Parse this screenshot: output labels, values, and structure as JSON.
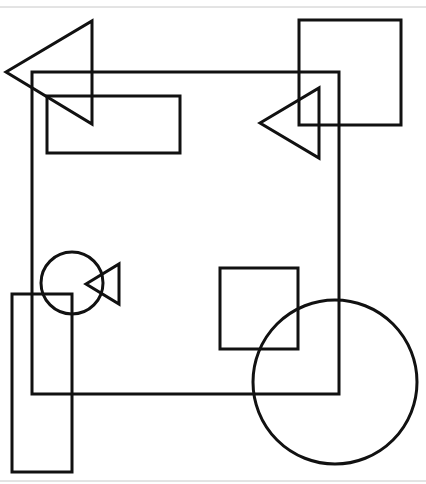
{
  "canvas": {
    "width": 426,
    "height": 484,
    "background": "#ffffff",
    "stroke": "#111111",
    "stroke_width": 3,
    "rule_color": "#c8c8c8"
  },
  "rules": [
    {
      "name": "top-rule",
      "x1": 0,
      "y1": 7,
      "x2": 426,
      "y2": 7
    },
    {
      "name": "bottom-rule",
      "x1": 0,
      "y1": 481,
      "x2": 426,
      "y2": 481
    }
  ],
  "shapes": [
    {
      "type": "rect",
      "name": "large-square",
      "x": 32,
      "y": 72,
      "w": 307,
      "h": 322
    },
    {
      "type": "polygon",
      "name": "triangle-top-left",
      "points": "6,72 92,21 92,124"
    },
    {
      "type": "rect",
      "name": "wide-rectangle",
      "x": 47,
      "y": 96,
      "w": 133,
      "h": 57
    },
    {
      "type": "rect",
      "name": "square-top-right",
      "x": 299,
      "y": 20,
      "w": 102,
      "h": 105
    },
    {
      "type": "polygon",
      "name": "triangle-right",
      "points": "260,123 319,88 319,158"
    },
    {
      "type": "circle",
      "name": "small-circle",
      "cx": 72,
      "cy": 283,
      "r": 31
    },
    {
      "type": "polygon",
      "name": "small-triangle",
      "points": "86,284 119,264 119,304"
    },
    {
      "type": "rect",
      "name": "tall-rectangle",
      "x": 12,
      "y": 294,
      "w": 60,
      "h": 178
    },
    {
      "type": "rect",
      "name": "small-square",
      "x": 220,
      "y": 268,
      "w": 78,
      "h": 81
    },
    {
      "type": "circle",
      "name": "large-circle",
      "cx": 335,
      "cy": 382,
      "r": 82
    }
  ]
}
